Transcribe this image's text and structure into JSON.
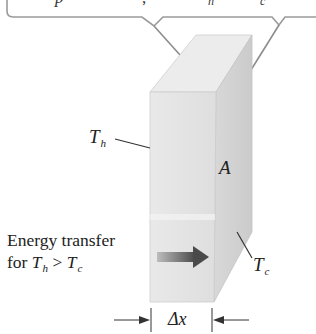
{
  "diagram": {
    "type": "heat-conduction-slab",
    "callout": {
      "text_visible": "(top text cropped; only descenders visible)",
      "fragments": [
        "p",
        ",",
        "h",
        "c"
      ]
    },
    "labels": {
      "hot_face": {
        "symbol": "T",
        "subscript": "h"
      },
      "cold_face": {
        "symbol": "T",
        "subscript": "c"
      },
      "area": "A",
      "thickness": "Δx"
    },
    "caption": {
      "line1": "Energy transfer",
      "line2_prefix": "for ",
      "line2_T1": "T",
      "line2_sub1": "h",
      "line2_op": " > ",
      "line2_T2": "T",
      "line2_sub2": "c"
    },
    "colors": {
      "front_face": "#e6e6e6",
      "side_face": "#d4d4d4",
      "top_face": "#ececec",
      "callout_border": "#9a9a9a",
      "arrow_dark": "#4a4a4a",
      "leader": "#333333"
    }
  }
}
